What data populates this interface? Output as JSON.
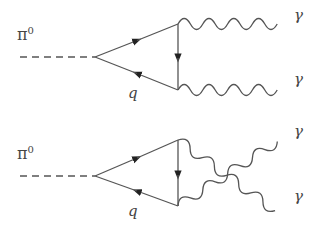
{
  "diagrams": [
    {
      "name": "direct",
      "incoming": {
        "label": "π",
        "superscript": "0"
      },
      "loop_label": "q",
      "outgoing": [
        {
          "label": "γ"
        },
        {
          "label": "γ"
        }
      ]
    },
    {
      "name": "crossed",
      "incoming": {
        "label": "π",
        "superscript": "0"
      },
      "loop_label": "q",
      "outgoing": [
        {
          "label": "γ"
        },
        {
          "label": "γ"
        }
      ]
    }
  ],
  "colors": {
    "line": "#555555",
    "text": "#444444",
    "background": "#ffffff"
  }
}
